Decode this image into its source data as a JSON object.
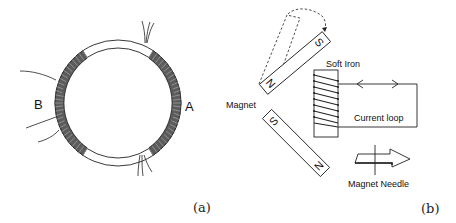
{
  "figure": {
    "panels": [
      {
        "id": "a",
        "caption": "(a)",
        "subject": "ring with two coils",
        "labels": {
          "left_coil": "B",
          "right_coil": "A"
        }
      },
      {
        "id": "b",
        "caption": "(b)",
        "labels": {
          "magnet": "Magnet",
          "soft_iron": "Soft Iron",
          "current_loop": "Current loop",
          "needle": "Magnet Needle",
          "pole_n": "N",
          "pole_s": "S"
        }
      }
    ],
    "colors": {
      "line": "#222222",
      "coil_fill": "#6a6a6a",
      "coil_stripe": "#d0d0d0",
      "background": "#ffffff"
    }
  }
}
